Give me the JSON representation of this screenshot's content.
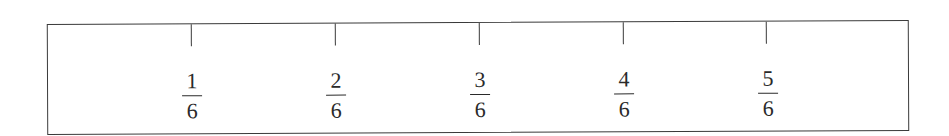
{
  "diagram": {
    "type": "fraction-strip",
    "total_parts": 6,
    "marks": [
      {
        "numerator": "1",
        "denominator": "6",
        "x": 143
      },
      {
        "numerator": "2",
        "denominator": "6",
        "x": 287
      },
      {
        "numerator": "3",
        "denominator": "6",
        "x": 431
      },
      {
        "numerator": "4",
        "denominator": "6",
        "x": 575
      },
      {
        "numerator": "5",
        "denominator": "6",
        "x": 718
      }
    ]
  }
}
